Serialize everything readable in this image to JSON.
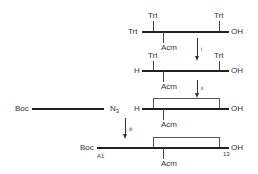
{
  "diagram": {
    "type": "peptide synthesis scheme",
    "row1": {
      "top_left": "Trt",
      "top_right": "Trt",
      "left": "Trt",
      "right": "OH",
      "bottom": "Acm"
    },
    "step1": {
      "label": "i"
    },
    "row2": {
      "top_left": "Trt",
      "top_right": "Trt",
      "left": "H",
      "right": "OH",
      "bottom": "Acm"
    },
    "step2": {
      "label": "ii"
    },
    "row3": {
      "left": "H",
      "right": "OH",
      "bottom": "Acm"
    },
    "fragment": {
      "left": "Boc",
      "right": "N",
      "right_sub": "3"
    },
    "step3": {
      "label": "iii"
    },
    "row4": {
      "left": "Boc",
      "left_sub": "A1",
      "right": "OH",
      "right_sub": "13",
      "bottom": "Acm"
    }
  }
}
